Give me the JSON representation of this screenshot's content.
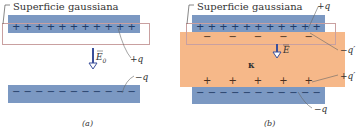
{
  "panel_a": {
    "surface_label": "Superficie gaussiana",
    "top_charge_label": "+q",
    "bottom_charge_label": "−q",
    "field_label": "E",
    "field_subscript": "0",
    "caption": "(a)",
    "top_symbols": [
      "+",
      "+",
      "+",
      "+",
      "+",
      "+",
      "+",
      "+",
      "+",
      "+",
      "+"
    ],
    "bottom_symbols": [
      "−",
      "−",
      "−",
      "−",
      "−",
      "−",
      "−",
      "−",
      "−",
      "−",
      "−"
    ]
  },
  "panel_b": {
    "surface_label": "Superficie gaussiana",
    "top_charge_label": "+q",
    "induced_top_label": "−q′",
    "induced_bottom_label": "+q′",
    "bottom_charge_label": "−q",
    "field_label": "E",
    "dielectric_label": "κ",
    "caption": "(b)",
    "top_symbols": [
      "+",
      "+",
      "+",
      "+",
      "+",
      "+",
      "+",
      "+",
      "+",
      "+",
      "+"
    ],
    "induced_top_symbols": [
      "−",
      "−",
      "−",
      "−",
      "−"
    ],
    "induced_bottom_symbols": [
      "+",
      "+",
      "+",
      "+",
      "+"
    ],
    "bottom_symbols": [
      "−",
      "−",
      "−",
      "−",
      "−",
      "−",
      "−",
      "−",
      "−",
      "−",
      "−"
    ]
  },
  "colors": {
    "plate": "#7b98c2",
    "dielectric": "#f6b889",
    "gaussian_outline": "#c9a0a0",
    "arrow": "#3a4f9a"
  }
}
